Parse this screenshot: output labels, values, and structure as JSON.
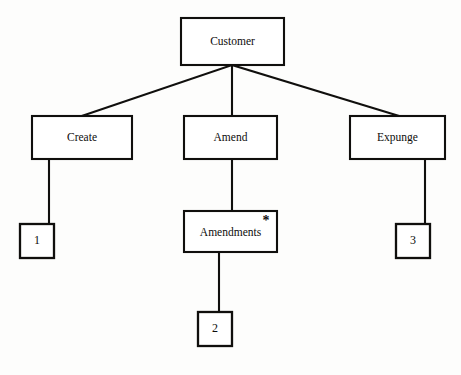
{
  "diagram": {
    "type": "tree-decomposition-diagram",
    "colors": {
      "background": "#fdfdfc",
      "box_fill": "#ffffff",
      "stroke": "#100f0d",
      "text": "#0d0c0b"
    },
    "nodes": [
      {
        "id": "customer",
        "label": "Customer",
        "shape": "rectangle",
        "size": "large",
        "x": 181,
        "y": 18,
        "w": 103,
        "h": 47,
        "marker": ""
      },
      {
        "id": "create",
        "label": "Create",
        "shape": "rectangle",
        "size": "large",
        "x": 32,
        "y": 116,
        "w": 100,
        "h": 43,
        "marker": ""
      },
      {
        "id": "amend",
        "label": "Amend",
        "shape": "rectangle",
        "size": "large",
        "x": 184,
        "y": 116,
        "w": 93,
        "h": 43,
        "marker": ""
      },
      {
        "id": "expunge",
        "label": "Expunge",
        "shape": "rectangle",
        "size": "large",
        "x": 350,
        "y": 116,
        "w": 95,
        "h": 43,
        "marker": ""
      },
      {
        "id": "amendments",
        "label": "Amendments",
        "shape": "rectangle",
        "size": "large",
        "x": 184,
        "y": 211,
        "w": 93,
        "h": 41,
        "marker": "*"
      },
      {
        "id": "leaf-1",
        "label": "1",
        "shape": "rectangle",
        "size": "small",
        "x": 20,
        "y": 224,
        "w": 34,
        "h": 34,
        "marker": ""
      },
      {
        "id": "leaf-2",
        "label": "2",
        "shape": "rectangle",
        "size": "small",
        "x": 198,
        "y": 312,
        "w": 34,
        "h": 34,
        "marker": ""
      },
      {
        "id": "leaf-3",
        "label": "3",
        "shape": "rectangle",
        "size": "small",
        "x": 396,
        "y": 224,
        "w": 34,
        "h": 34,
        "marker": ""
      }
    ],
    "edges": [
      {
        "id": "customer-create",
        "from": "customer",
        "to": "create",
        "points": "232,65 82,116"
      },
      {
        "id": "customer-amend",
        "from": "customer",
        "to": "amend",
        "points": "232,65 232,116"
      },
      {
        "id": "customer-expunge",
        "from": "customer",
        "to": "expunge",
        "points": "232,65 399,116"
      },
      {
        "id": "create-leaf1",
        "from": "create",
        "to": "leaf-1",
        "points": "49,159 49,224"
      },
      {
        "id": "amend-amendments",
        "from": "amend",
        "to": "amendments",
        "points": "232,159 232,211"
      },
      {
        "id": "expunge-leaf3",
        "from": "expunge",
        "to": "leaf-3",
        "points": "425,159 425,224"
      },
      {
        "id": "amendments-leaf2",
        "from": "amendments",
        "to": "leaf-2",
        "points": "219,252 219,312"
      }
    ]
  }
}
